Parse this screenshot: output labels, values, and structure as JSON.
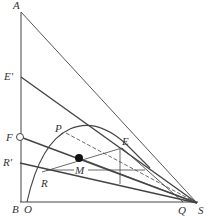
{
  "diagram": {
    "labels": {
      "A": "A",
      "E_prime": "E′",
      "F": "F",
      "R_prime": "R′",
      "B": "B",
      "O": "O",
      "P": "P",
      "E": "E",
      "M": "M",
      "R": "R",
      "Q": "Q",
      "S": "S"
    },
    "colors": {
      "line": "#444444",
      "text": "#333333",
      "background": "#ffffff"
    }
  }
}
